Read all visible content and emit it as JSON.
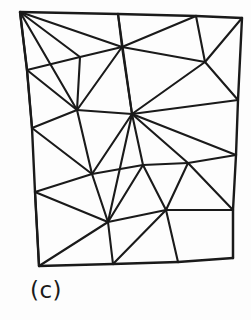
{
  "figure": {
    "caption": "(c)",
    "kind": "triangular-mesh-diagram",
    "line_color": "#1a1a1a",
    "background_color": "#fdfdfd",
    "width": 251,
    "height": 320
  },
  "chart_data": {
    "type": "diagram",
    "title": "(c)",
    "subtitle": "",
    "xlabel": "",
    "ylabel": "",
    "vertex_count": 22,
    "edge_count": 51,
    "vertices": [
      {
        "id": 0,
        "name": "corner-top-left",
        "x": 20,
        "y": 12,
        "on_boundary": true
      },
      {
        "id": 1,
        "name": "top-edge-1",
        "x": 118,
        "y": 14,
        "on_boundary": true
      },
      {
        "id": 2,
        "name": "top-edge-2",
        "x": 196,
        "y": 16,
        "on_boundary": true
      },
      {
        "id": 3,
        "name": "corner-top-right",
        "x": 242,
        "y": 18,
        "on_boundary": true
      },
      {
        "id": 4,
        "name": "right-edge-1",
        "x": 238,
        "y": 100,
        "on_boundary": true
      },
      {
        "id": 5,
        "name": "right-edge-2",
        "x": 236,
        "y": 155,
        "on_boundary": true
      },
      {
        "id": 6,
        "name": "right-edge-3",
        "x": 233,
        "y": 210,
        "on_boundary": true
      },
      {
        "id": 7,
        "name": "corner-bottom-right",
        "x": 233,
        "y": 258,
        "on_boundary": true
      },
      {
        "id": 8,
        "name": "bottom-edge-2",
        "x": 178,
        "y": 262,
        "on_boundary": true
      },
      {
        "id": 9,
        "name": "bottom-edge-1",
        "x": 113,
        "y": 264,
        "on_boundary": true
      },
      {
        "id": 10,
        "name": "corner-bottom-left",
        "x": 39,
        "y": 266,
        "on_boundary": true
      },
      {
        "id": 11,
        "name": "left-edge-3",
        "x": 35,
        "y": 192,
        "on_boundary": true
      },
      {
        "id": 12,
        "name": "left-edge-2",
        "x": 32,
        "y": 128,
        "on_boundary": true
      },
      {
        "id": 13,
        "name": "left-edge-1",
        "x": 27,
        "y": 70,
        "on_boundary": true
      },
      {
        "id": 14,
        "name": "interior-upper-left",
        "x": 80,
        "y": 57,
        "on_boundary": false
      },
      {
        "id": 15,
        "name": "interior-upper-mid",
        "x": 122,
        "y": 47,
        "on_boundary": false
      },
      {
        "id": 16,
        "name": "interior-upper-right",
        "x": 205,
        "y": 62,
        "on_boundary": false
      },
      {
        "id": 17,
        "name": "interior-mid-left",
        "x": 77,
        "y": 110,
        "on_boundary": false
      },
      {
        "id": 18,
        "name": "interior-center-hub",
        "x": 132,
        "y": 114,
        "on_boundary": false
      },
      {
        "id": 19,
        "name": "interior-lower-left",
        "x": 92,
        "y": 174,
        "on_boundary": false
      },
      {
        "id": 20,
        "name": "interior-lower-mid",
        "x": 143,
        "y": 165,
        "on_boundary": false
      },
      {
        "id": 21,
        "name": "interior-lower-right",
        "x": 188,
        "y": 163,
        "on_boundary": false
      },
      {
        "id": 22,
        "name": "interior-bottom-mid",
        "x": 108,
        "y": 222,
        "on_boundary": false
      },
      {
        "id": 23,
        "name": "interior-bottom-right",
        "x": 166,
        "y": 210,
        "on_boundary": false
      }
    ],
    "boundary_edges": [
      [
        0,
        1
      ],
      [
        1,
        2
      ],
      [
        2,
        3
      ],
      [
        3,
        4
      ],
      [
        4,
        5
      ],
      [
        5,
        6
      ],
      [
        6,
        7
      ],
      [
        7,
        8
      ],
      [
        8,
        9
      ],
      [
        9,
        10
      ],
      [
        10,
        11
      ],
      [
        11,
        12
      ],
      [
        12,
        13
      ],
      [
        13,
        0
      ]
    ],
    "interior_edges": [
      [
        0,
        13
      ],
      [
        0,
        14
      ],
      [
        0,
        15
      ],
      [
        0,
        17
      ],
      [
        13,
        14
      ],
      [
        13,
        17
      ],
      [
        13,
        12
      ],
      [
        14,
        15
      ],
      [
        14,
        17
      ],
      [
        15,
        1
      ],
      [
        15,
        2
      ],
      [
        15,
        16
      ],
      [
        15,
        18
      ],
      [
        15,
        17
      ],
      [
        1,
        18
      ],
      [
        2,
        16
      ],
      [
        3,
        16
      ],
      [
        16,
        4
      ],
      [
        16,
        18
      ],
      [
        4,
        18
      ],
      [
        12,
        17
      ],
      [
        12,
        19
      ],
      [
        17,
        18
      ],
      [
        17,
        19
      ],
      [
        18,
        19
      ],
      [
        18,
        20
      ],
      [
        18,
        21
      ],
      [
        18,
        5
      ],
      [
        18,
        22
      ],
      [
        5,
        21
      ],
      [
        21,
        20
      ],
      [
        21,
        23
      ],
      [
        21,
        6
      ],
      [
        20,
        19
      ],
      [
        20,
        22
      ],
      [
        20,
        23
      ],
      [
        19,
        11
      ],
      [
        19,
        22
      ],
      [
        11,
        22
      ],
      [
        11,
        10
      ],
      [
        22,
        9
      ],
      [
        22,
        10
      ],
      [
        22,
        23
      ],
      [
        23,
        6
      ],
      [
        23,
        8
      ],
      [
        23,
        9
      ],
      [
        6,
        7
      ]
    ]
  }
}
